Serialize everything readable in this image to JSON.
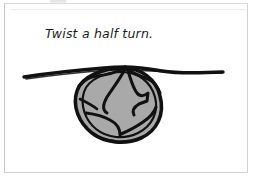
{
  "page": {
    "background_color": "#ffffff",
    "width": 253,
    "height": 182
  },
  "figure": {
    "frame_color": "#d2d2d2",
    "caption": "Twist a half turn.",
    "illustration": {
      "name": "rope-half-twist-knot-diagram",
      "description": "Hand-drawn illustration of a horizontal cord twisted into a half turn forming a gray loop",
      "ink_color": "#111111",
      "fill_color": "#a9a9a9",
      "parts": [
        {
          "name": "cord-left-tail",
          "label": "left cord end"
        },
        {
          "name": "cord-right-tail",
          "label": "right cord end"
        },
        {
          "name": "knot-loop",
          "label": "twisted loop"
        },
        {
          "name": "knot-crossing",
          "label": "crossing point"
        }
      ]
    }
  }
}
